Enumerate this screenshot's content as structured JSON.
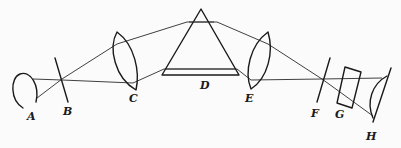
{
  "diagram": {
    "labels": {
      "A": "A",
      "B": "B",
      "C": "C",
      "D": "D",
      "E": "E",
      "F": "F",
      "G": "G",
      "H": "H"
    },
    "components": [
      {
        "id": "A",
        "kind": "source reflector (arc)"
      },
      {
        "id": "B",
        "kind": "slit"
      },
      {
        "id": "C",
        "kind": "collimating lens"
      },
      {
        "id": "D",
        "kind": "prism"
      },
      {
        "id": "E",
        "kind": "focusing lens"
      },
      {
        "id": "F",
        "kind": "exit slit"
      },
      {
        "id": "G",
        "kind": "cell / plate"
      },
      {
        "id": "H",
        "kind": "concave mirror / detector"
      }
    ],
    "colors": {
      "line": "#1a1a1a",
      "background": "#fbfbfb"
    }
  }
}
